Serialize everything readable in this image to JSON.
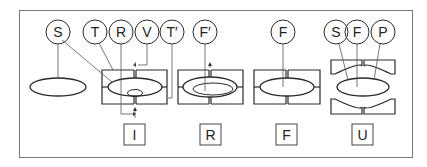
{
  "diagram": {
    "type": "schematic",
    "colors": {
      "line": "#2a2a2a",
      "background": "#ffffff",
      "frame": "#777777"
    },
    "circle_labels": {
      "S1": "S",
      "T": "T",
      "R": "R",
      "V": "V",
      "T_prime": "T′",
      "F_prime": "F′",
      "F": "F",
      "S2": "S",
      "F2": "F",
      "P": "P"
    },
    "state_labels": {
      "I": "I",
      "R": "R",
      "F": "F",
      "U": "U"
    },
    "stages": [
      {
        "id": "free",
        "circle_labels": [
          "S"
        ],
        "state_label": ""
      },
      {
        "id": "I",
        "circle_labels": [
          "T",
          "R",
          "V",
          "T′"
        ],
        "state_label": "I"
      },
      {
        "id": "R",
        "circle_labels": [
          "F′"
        ],
        "state_label": "R"
      },
      {
        "id": "F",
        "circle_labels": [
          "F"
        ],
        "state_label": "F"
      },
      {
        "id": "U",
        "circle_labels": [
          "S",
          "F",
          "P"
        ],
        "state_label": "U"
      }
    ]
  }
}
